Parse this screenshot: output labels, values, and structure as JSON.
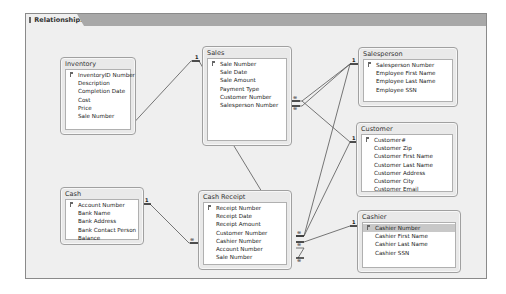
{
  "window": {
    "tab_label": "Relationships",
    "tab_icon": "relationships-icon"
  },
  "tables": {
    "inventory": {
      "title": "Inventory",
      "fields": [
        "InventoryID Number",
        "Description",
        "Completion Date",
        "Cost",
        "Price",
        "Sale Number"
      ],
      "primary_key": "InventoryID Number"
    },
    "sales": {
      "title": "Sales",
      "fields": [
        "Sale Number",
        "Sale Date",
        "Sale Amount",
        "Payment Type",
        "Customer Number",
        "Salesperson Number"
      ],
      "primary_key": "Sale Number"
    },
    "salesperson": {
      "title": "Salesperson",
      "fields": [
        "Salesperson Number",
        "Employee First Name",
        "Employee Last Name",
        "Employee SSN"
      ],
      "primary_key": "Salesperson Number"
    },
    "customer": {
      "title": "Customer",
      "fields": [
        "Customer#",
        "Customer Zip",
        "Customer First Name",
        "Customer Last Name",
        "Customer Address",
        "Customer City",
        "Customer Email"
      ],
      "primary_key": "Customer#"
    },
    "cash": {
      "title": "Cash",
      "fields": [
        "Account Number",
        "Bank Name",
        "Bank Address",
        "Bank Contact Person",
        "Balance"
      ],
      "primary_key": "Account Number"
    },
    "cash_receipt": {
      "title": "Cash Receipt",
      "fields": [
        "Receipt Number",
        "Receipt Date",
        "Receipt Amount",
        "Customer Number",
        "Cashier Number",
        "Account Number",
        "Sale Number"
      ],
      "primary_key": "Receipt Number"
    },
    "cashier": {
      "title": "Cashier",
      "fields": [
        "Cashier Number",
        "Cashier First Name",
        "Cashier Last Name",
        "Cashier SSN"
      ],
      "primary_key": "Cashier Number",
      "selected_field": "Cashier Number"
    }
  },
  "relationships": [
    {
      "from": "Sales.Sale Number",
      "to": "Inventory.Sale Number",
      "one_label": "1",
      "many_label": "∞"
    },
    {
      "from": "Salesperson.Salesperson Number",
      "to": "Sales.Salesperson Number",
      "one_label": "1",
      "many_label": "∞"
    },
    {
      "from": "Customer.Customer#",
      "to": "Sales.Customer Number",
      "one_label": "1",
      "many_label": "∞"
    },
    {
      "from": "Sales.Sale Number",
      "to": "Cash Receipt.Sale Number",
      "one_label": "1",
      "many_label": "∞"
    },
    {
      "from": "Cash.Account Number",
      "to": "Cash Receipt.Account Number",
      "one_label": "1",
      "many_label": "∞"
    },
    {
      "from": "Customer.Customer#",
      "to": "Cash Receipt.Customer Number",
      "one_label": "1",
      "many_label": "∞"
    },
    {
      "from": "Salesperson.Salesperson Number",
      "to": "Cash Receipt.Customer Number",
      "one_label": "1",
      "many_label": "∞"
    },
    {
      "from": "Cashier.Cashier Number",
      "to": "Cash Receipt.Cashier Number",
      "one_label": "1",
      "many_label": "∞"
    }
  ]
}
